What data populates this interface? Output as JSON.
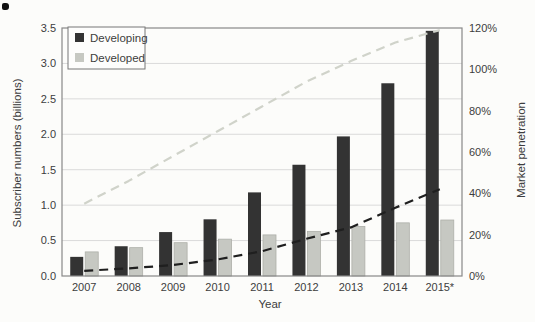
{
  "chart_data": {
    "type": "bar",
    "subtype": "grouped-bars-with-dashed-lines-dual-axis",
    "title": "",
    "xlabel": "Year",
    "categories": [
      "2007",
      "2008",
      "2009",
      "2010",
      "2011",
      "2012",
      "2013",
      "2014",
      "2015*"
    ],
    "bar_series": [
      {
        "name": "Developing",
        "axis": "left",
        "color": "#333333",
        "values": [
          0.27,
          0.42,
          0.62,
          0.8,
          1.18,
          1.57,
          1.97,
          2.72,
          3.46
        ]
      },
      {
        "name": "Developed",
        "axis": "left",
        "color": "#c6c8c2",
        "edge_color": "#adafa9",
        "values": [
          0.34,
          0.4,
          0.47,
          0.52,
          0.58,
          0.63,
          0.7,
          0.75,
          0.79
        ]
      }
    ],
    "line_series": [
      {
        "name": "Developed market penetration",
        "axis": "right",
        "color": "#d0d3ca",
        "style": "dashed",
        "values": [
          35,
          46,
          58,
          70,
          82,
          94,
          104,
          113,
          119
        ]
      },
      {
        "name": "Developing market penetration",
        "axis": "right",
        "color": "#1f1f1f",
        "style": "dashed",
        "values": [
          2.5,
          3.7,
          5.3,
          8,
          12,
          18,
          23.5,
          33,
          42
        ]
      }
    ],
    "left_axis": {
      "label": "Subscriber numbers (billions)",
      "min": 0,
      "max": 3.5,
      "step": 0.5,
      "tick_labels": [
        "0.0",
        "0.5",
        "1.0",
        "1.5",
        "2.0",
        "2.5",
        "3.0",
        "3.5"
      ]
    },
    "right_axis": {
      "label": "Market penetration",
      "min": 0,
      "max": 120,
      "step": 20,
      "tick_labels": [
        "0%",
        "20%",
        "40%",
        "60%",
        "80%",
        "100%",
        "120%"
      ]
    },
    "legend": {
      "position": "top-left-inside",
      "items": [
        {
          "label": "Developing",
          "color": "#333333"
        },
        {
          "label": "Developed",
          "color": "#c6c8c2"
        }
      ]
    },
    "grid": true,
    "grid_color": "#dadada",
    "border_color": "#888888",
    "background": "#fcfcfa"
  }
}
